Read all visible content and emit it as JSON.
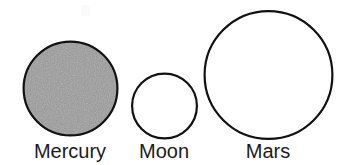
{
  "figure": {
    "title_present": false,
    "background_color": "#ffffff",
    "width": 356,
    "height": 165
  },
  "chart_data": {
    "type": "scatter",
    "title": "",
    "xlabel": "",
    "ylabel": "",
    "legend_position": "below-each-shape",
    "grid": false,
    "categories": [
      "Mercury",
      "Moon",
      "Mars"
    ],
    "values": [
      97,
      68,
      131
    ],
    "value_units": "pixel diameter",
    "series": [
      {
        "name": "Relative diameter",
        "values": [
          97,
          68,
          131
        ]
      }
    ],
    "items": [
      {
        "label": "Mercury",
        "shape": "circle",
        "cx": 70.5,
        "cy": 88.5,
        "r": 48.0,
        "diameter": 96.0,
        "fill": "#9c9c9c",
        "stroke": "#111111",
        "stroke_width": 2.2,
        "filled": true,
        "texture": "speckled-gray"
      },
      {
        "label": "Moon",
        "shape": "circle",
        "cx": 164.5,
        "cy": 106.0,
        "r": 33.5,
        "diameter": 67.0,
        "fill": "#ffffff",
        "stroke": "#111111",
        "stroke_width": 2.2,
        "filled": false,
        "texture": "none"
      },
      {
        "label": "Mars",
        "shape": "circle",
        "cx": 268.5,
        "cy": 75.0,
        "r": 65.0,
        "diameter": 130.0,
        "fill": "#ffffff",
        "stroke": "#111111",
        "stroke_width": 2.2,
        "filled": false,
        "texture": "none"
      }
    ]
  },
  "labels": {
    "mercury": "Mercury",
    "moon": "Moon",
    "mars": "Mars"
  },
  "colors": {
    "outline": "#111111",
    "mercury_fill": "#9c9c9c",
    "empty_fill": "#ffffff",
    "label_text": "#1b1b1b",
    "background": "#ffffff"
  }
}
